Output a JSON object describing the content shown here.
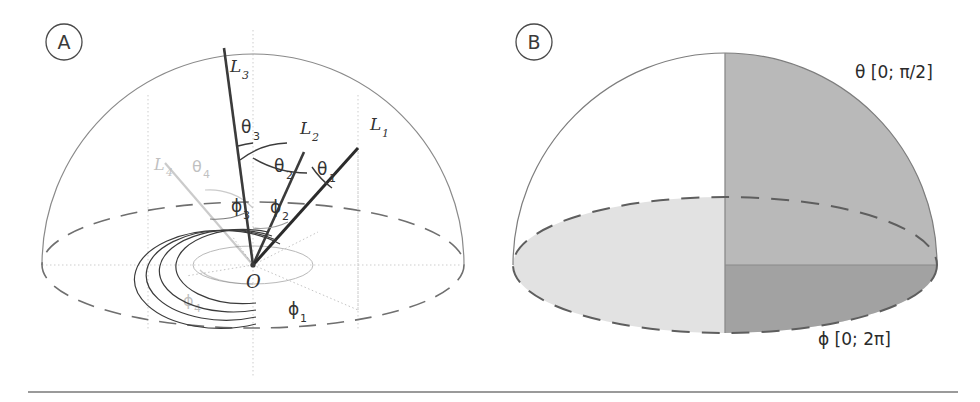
{
  "figure": {
    "background": "#ffffff",
    "width": 980,
    "height": 402,
    "separator_color": "#9a9a9a"
  },
  "panels": [
    {
      "id": "A",
      "letter": "A",
      "caption_region": "spherical coordinate definition with four direction vectors",
      "origin_label": "O",
      "vectors": [
        {
          "name": "L1",
          "label": "L",
          "sub": "1",
          "theta_label": "θ",
          "theta_sub": "1",
          "phi_label": "ϕ",
          "phi_sub": "1",
          "style": "dark"
        },
        {
          "name": "L2",
          "label": "L",
          "sub": "2",
          "theta_label": "θ",
          "theta_sub": "2",
          "phi_label": "ϕ",
          "phi_sub": "2",
          "style": "dark"
        },
        {
          "name": "L3",
          "label": "L",
          "sub": "3",
          "theta_label": "θ",
          "theta_sub": "3",
          "phi_label": "ϕ",
          "phi_sub": "3",
          "style": "dark"
        },
        {
          "name": "L4",
          "label": "L",
          "sub": "4",
          "theta_label": "θ",
          "theta_sub": "4",
          "phi_label": "ϕ",
          "phi_sub": "4",
          "style": "faint"
        }
      ]
    },
    {
      "id": "B",
      "letter": "B",
      "caption_region": "hemisphere showing parameter ranges",
      "theta_range": "θ [0; π/2]",
      "phi_range": "ϕ [0; 2π]",
      "shading": {
        "base_disk": "#e2e2e2",
        "quarter_sphere": "#b9b9b9",
        "overlap_wedge": "#a2a2a2"
      }
    }
  ],
  "colors": {
    "stroke_dark": "#2f2f2f",
    "stroke_mid": "#555555",
    "stroke_light": "#8f8f8f",
    "grid_dotted": "#c9c9c9",
    "faint_gray": "#b5b5b5"
  }
}
